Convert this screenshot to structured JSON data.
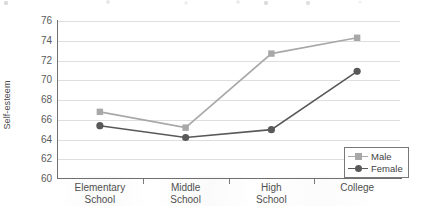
{
  "chart_data": {
    "type": "line",
    "title": "",
    "xlabel": "",
    "ylabel": "Self-esteem",
    "categories": [
      "Elementary School",
      "Middle School",
      "High School",
      "College"
    ],
    "category_lines": [
      [
        "Elementary",
        "School"
      ],
      [
        "Middle",
        "School"
      ],
      [
        "High",
        "School"
      ],
      [
        "College"
      ]
    ],
    "ylim": [
      60,
      76
    ],
    "yticks": [
      76,
      74,
      72,
      70,
      68,
      66,
      64,
      62,
      60
    ],
    "ytick_labels": [
      "76",
      "74",
      "72",
      "70",
      "68",
      "66",
      "64",
      "62",
      "60"
    ],
    "grid": "horizontal",
    "legend_position": "bottom-right",
    "series": [
      {
        "name": "Male",
        "color": "#a8a8a8",
        "marker": "square",
        "values": [
          66.8,
          65.2,
          72.7,
          74.3
        ]
      },
      {
        "name": "Female",
        "color": "#595959",
        "marker": "circle",
        "values": [
          65.4,
          64.2,
          65.0,
          70.9
        ]
      }
    ]
  },
  "axes": {
    "y_title": "Self-esteem"
  },
  "legend": {
    "items": [
      {
        "label": "Male"
      },
      {
        "label": "Female"
      }
    ]
  },
  "colors": {
    "male": "#a8a8a8",
    "female": "#595959",
    "grid": "#dedede",
    "axis": "#6f6f6f",
    "text": "#4f4f4f"
  }
}
